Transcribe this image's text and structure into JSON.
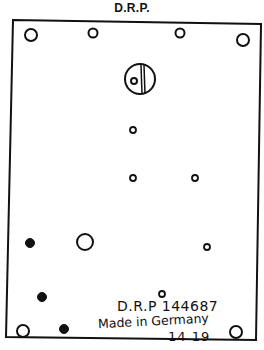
{
  "title": "D.R.P.",
  "plate": {
    "outline": [
      [
        13,
        20
      ],
      [
        261,
        24
      ],
      [
        256,
        340
      ],
      [
        6,
        337
      ]
    ],
    "stroke_color": "#111111"
  },
  "holes": {
    "open_large": [
      {
        "cx": 31,
        "cy": 35,
        "r": 6
      },
      {
        "cx": 243,
        "cy": 40,
        "r": 6
      },
      {
        "cx": 85,
        "cy": 242,
        "r": 8
      },
      {
        "cx": 23,
        "cy": 331,
        "r": 6
      },
      {
        "cx": 236,
        "cy": 332,
        "r": 6
      }
    ],
    "open_medium": [
      {
        "cx": 93,
        "cy": 33,
        "r": 4.5
      },
      {
        "cx": 180,
        "cy": 33,
        "r": 4.5
      }
    ],
    "open_small": [
      {
        "cx": 133,
        "cy": 130,
        "r": 3
      },
      {
        "cx": 133,
        "cy": 178,
        "r": 3
      },
      {
        "cx": 195,
        "cy": 178,
        "r": 3
      },
      {
        "cx": 207,
        "cy": 247,
        "r": 3
      },
      {
        "cx": 162,
        "cy": 294,
        "r": 3
      }
    ],
    "filled": [
      {
        "cx": 30,
        "cy": 243,
        "r": 4.5
      },
      {
        "cx": 42,
        "cy": 297,
        "r": 4.5
      },
      {
        "cx": 64,
        "cy": 329,
        "r": 4.5
      }
    ]
  },
  "screw": {
    "cx": 140,
    "cy": 79,
    "r": 15,
    "inner_cx": 134,
    "inner_cy": 81,
    "inner_r": 3
  },
  "stamp": {
    "line1": "D.R.P 144687",
    "line2": "Made in Germany",
    "line3": "14 19"
  }
}
